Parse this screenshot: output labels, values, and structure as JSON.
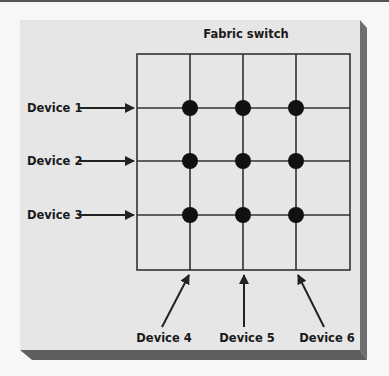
{
  "diagram": {
    "title": "Fabric switch",
    "grid": {
      "columns": 4,
      "rows": 4
    },
    "input_devices": [
      {
        "label": "Device 1",
        "row": 1
      },
      {
        "label": "Device 2",
        "row": 2
      },
      {
        "label": "Device 3",
        "row": 3
      }
    ],
    "output_devices": [
      {
        "label": "Device 4",
        "column": 1
      },
      {
        "label": "Device 5",
        "column": 2
      },
      {
        "label": "Device 6",
        "column": 3
      }
    ],
    "crosspoints": [
      [
        1,
        1
      ],
      [
        1,
        2
      ],
      [
        1,
        3
      ],
      [
        2,
        1
      ],
      [
        2,
        2
      ],
      [
        2,
        3
      ],
      [
        3,
        1
      ],
      [
        3,
        2
      ],
      [
        3,
        3
      ]
    ],
    "colors": {
      "panel": "#e6e6e6",
      "shadow": "#6e6e6e",
      "lines": "#333333",
      "dots": "#111111",
      "text": "#1a1a1a"
    }
  }
}
